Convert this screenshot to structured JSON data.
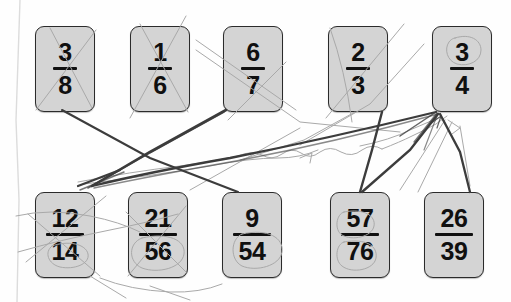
{
  "worksheet": {
    "title": "Fraction matching worksheet (scanned, hand-annotated)",
    "background_color": "#fefefe",
    "card_fill_color": "#d4d4d4",
    "card_border_color": "#2b2b2b",
    "ink_color": "#4a4a4a",
    "pencil_color": "#9a9a9a"
  },
  "top_row": {
    "label": "top-row",
    "cards": [
      {
        "name": "card-3-8",
        "numerator": "3",
        "denominator": "8",
        "x": 35,
        "y": 26,
        "w": 60,
        "h": 86,
        "digits": 1,
        "annotation": "crossed-out-x"
      },
      {
        "name": "card-1-6",
        "numerator": "1",
        "denominator": "6",
        "x": 130,
        "y": 26,
        "w": 60,
        "h": 86,
        "digits": 1,
        "annotation": "crossed-out-x"
      },
      {
        "name": "card-6-7",
        "numerator": "6",
        "denominator": "7",
        "x": 223,
        "y": 26,
        "w": 60,
        "h": 86,
        "digits": 1,
        "annotation": "crossed-out-x"
      },
      {
        "name": "card-2-3",
        "numerator": "2",
        "denominator": "3",
        "x": 328,
        "y": 26,
        "w": 60,
        "h": 86,
        "digits": 1,
        "annotation": "line-through"
      },
      {
        "name": "card-3-4",
        "numerator": "3",
        "denominator": "4",
        "x": 432,
        "y": 26,
        "w": 60,
        "h": 86,
        "digits": 1,
        "annotation": "circled"
      }
    ]
  },
  "bottom_row": {
    "label": "bottom-row",
    "cards": [
      {
        "name": "card-12-14",
        "numerator": "12",
        "denominator": "14",
        "x": 35,
        "y": 192,
        "w": 60,
        "h": 86,
        "digits": 2,
        "annotation": "crossed-out-x"
      },
      {
        "name": "card-21-56",
        "numerator": "21",
        "denominator": "56",
        "x": 128,
        "y": 192,
        "w": 60,
        "h": 86,
        "digits": 2,
        "annotation": "circled"
      },
      {
        "name": "card-9-54",
        "numerator": "9",
        "denominator": "54",
        "x": 222,
        "y": 192,
        "w": 60,
        "h": 86,
        "digits": 2,
        "annotation": "circled"
      },
      {
        "name": "card-57-76",
        "numerator": "57",
        "denominator": "76",
        "x": 330,
        "y": 192,
        "w": 60,
        "h": 86,
        "digits": 2,
        "annotation": "circled"
      },
      {
        "name": "card-26-39",
        "numerator": "26",
        "denominator": "39",
        "x": 424,
        "y": 192,
        "w": 60,
        "h": 86,
        "digits": 2,
        "annotation": "none"
      }
    ]
  },
  "connections": [
    {
      "name": "line-3-8-to-9-54",
      "from": "card-3-8",
      "to": "card-9-54",
      "style": "ink"
    },
    {
      "name": "line-1-6-to-21-56",
      "from": "card-1-6",
      "to": "card-21-56",
      "style": "pencil"
    },
    {
      "name": "line-6-7-to-12-14",
      "from": "card-6-7",
      "to": "card-12-14",
      "style": "ink"
    },
    {
      "name": "line-2-3-to-57-76",
      "from": "card-2-3",
      "to": "card-57-76",
      "style": "ink"
    },
    {
      "name": "line-3-4-to-12-14",
      "from": "card-3-4",
      "to": "card-12-14",
      "style": "ink"
    },
    {
      "name": "line-3-4-to-26-39",
      "from": "card-3-4",
      "to": "card-26-39",
      "style": "ink"
    },
    {
      "name": "line-3-4-to-57-76",
      "from": "card-3-4",
      "to": "card-57-76",
      "style": "ink"
    }
  ]
}
